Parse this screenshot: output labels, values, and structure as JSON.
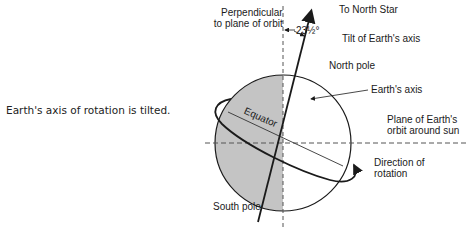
{
  "caption": {
    "figure_number": "Figure 6-6.",
    "text": "Earth's axis of rotation is tilted."
  },
  "diagram": {
    "labels": {
      "perpendicular_line1": "Perpendicular",
      "perpendicular_line2": "to plane of orbit",
      "angle": "23½°",
      "north_star": "To North Star",
      "tilt": "Tilt of Earth's axis",
      "north_pole": "North pole",
      "earths_axis": "Earth's axis",
      "plane_line1": "Plane of Earth's",
      "plane_line2": "orbit around sun",
      "equator": "Equator",
      "direction_line1": "Direction of",
      "direction_line2": "rotation",
      "south_pole": "South pole"
    },
    "colors": {
      "shade": "#c4c4c4",
      "line": "#1a1a1a",
      "dash": "#555555"
    }
  }
}
